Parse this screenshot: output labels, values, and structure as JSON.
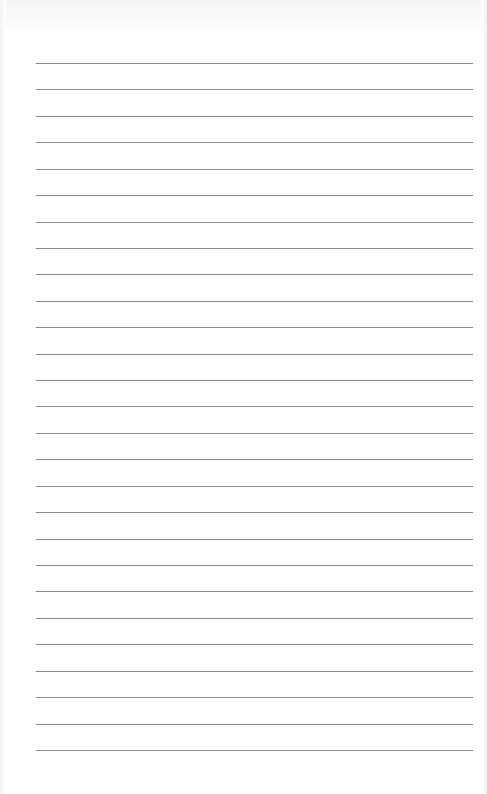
{
  "page": {
    "type": "blank lined paper",
    "background": "#ffffff",
    "line_color": "#8a8a8a",
    "line_count": 27,
    "first_line_y": 63,
    "line_spacing": 26.42,
    "line_left": 36,
    "line_width": 437
  }
}
